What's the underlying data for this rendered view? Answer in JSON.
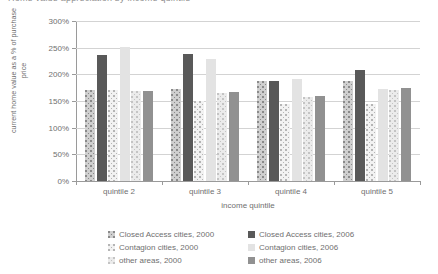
{
  "title": {
    "text": "Home value appreciation by income quintile"
  },
  "axes": {
    "ylabel": "current home value as a % of purchase price",
    "xlabel": "income quintile",
    "yticks": [
      "0%",
      "50%",
      "100%",
      "150%",
      "200%",
      "250%",
      "300%"
    ],
    "ytick_values": [
      0,
      50,
      100,
      150,
      200,
      250,
      300
    ],
    "xticks": [
      "quintile 2",
      "quintile 3",
      "quintile 4",
      "quintile 5"
    ]
  },
  "legend": {
    "items": [
      {
        "label": "Closed Access cities, 2000",
        "swatch": "dotted-medium-gray",
        "color": "#cfcfcf",
        "class": "s0"
      },
      {
        "label": "Closed Access cities, 2006",
        "swatch": "solid-dark-gray",
        "color": "#595959",
        "class": "s1"
      },
      {
        "label": "Contagion cities, 2000",
        "swatch": "dotted-light-gray",
        "color": "#f2f2f2",
        "class": "s2"
      },
      {
        "label": "Contagion cities, 2006",
        "swatch": "solid-very-light-gray",
        "color": "#e3e3e3",
        "class": "s3"
      },
      {
        "label": "other areas, 2000",
        "swatch": "dotted-pale-gray",
        "color": "#ebebeb",
        "class": "s4"
      },
      {
        "label": "other areas, 2006",
        "swatch": "solid-mid-gray",
        "color": "#919191",
        "class": "s5"
      }
    ],
    "order": [
      0,
      1,
      2,
      3,
      4,
      5
    ]
  },
  "chart_data": {
    "type": "bar",
    "title": "Home value appreciation by income quintile",
    "xlabel": "income quintile",
    "ylabel": "current home value as a % of purchase price",
    "ylim": [
      0,
      300
    ],
    "ytick_step": 50,
    "grid": true,
    "legend_position": "bottom",
    "categories": [
      "quintile 2",
      "quintile 3",
      "quintile 4",
      "quintile 5"
    ],
    "series": [
      {
        "name": "Closed Access cities, 2000",
        "color": "#cfcfcf",
        "values": [
          170,
          172,
          188,
          188
        ]
      },
      {
        "name": "Closed Access cities, 2006",
        "color": "#595959",
        "values": [
          236,
          238,
          188,
          208
        ]
      },
      {
        "name": "Contagion cities, 2000",
        "color": "#f2f2f2",
        "values": [
          170,
          150,
          145,
          145
        ]
      },
      {
        "name": "Contagion cities, 2006",
        "color": "#e3e3e3",
        "values": [
          252,
          228,
          192,
          172
        ]
      },
      {
        "name": "other areas, 2000",
        "color": "#ebebeb",
        "values": [
          168,
          165,
          158,
          170
        ]
      },
      {
        "name": "other areas, 2006",
        "color": "#919191",
        "values": [
          168,
          167,
          160,
          175
        ]
      }
    ]
  }
}
